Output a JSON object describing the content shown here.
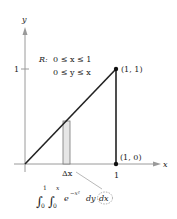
{
  "axes": {
    "x_label": "x",
    "y_label": "y",
    "x_tick": "1",
    "y_tick": "1"
  },
  "region": {
    "name": "R:",
    "constraint_1": "0 ≤ x ≤ 1",
    "constraint_2": "0 ≤ y ≤ x"
  },
  "points": [
    {
      "label": "(1, 1)",
      "x": 1,
      "y": 1
    },
    {
      "label": "(1, 0)",
      "x": 1,
      "y": 0
    }
  ],
  "strip": {
    "label": "Δx"
  },
  "integral": {
    "lower_outer": "0",
    "upper_outer": "1",
    "lower_inner": "0",
    "upper_inner": "x",
    "integrand": "e",
    "exponent": "−x²",
    "inner_diff": "dy",
    "outer_diff": "dx"
  },
  "colors": {
    "line": "#222222",
    "axis": "#888888",
    "strip_fill": "#e6e6e6"
  }
}
